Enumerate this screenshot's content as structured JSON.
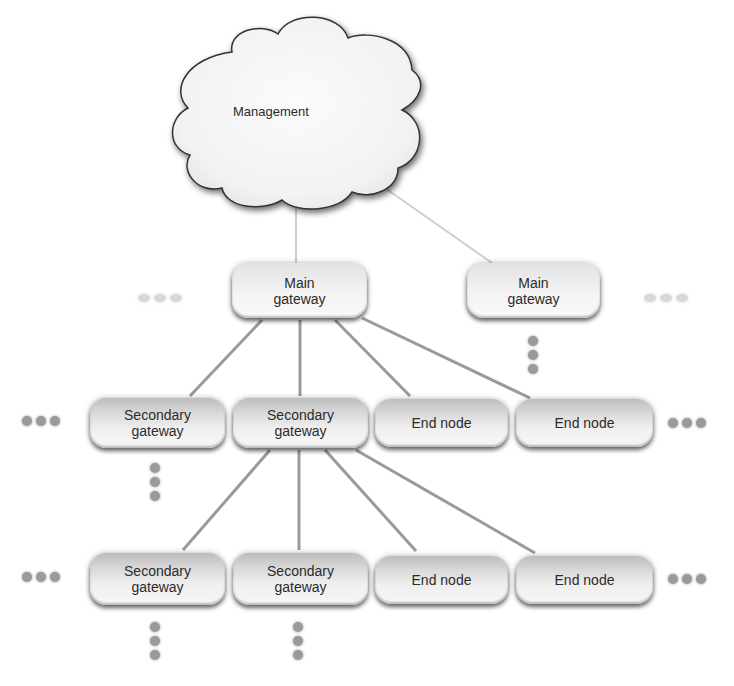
{
  "diagram": {
    "cloud": {
      "label": "Management"
    },
    "main_gateways": [
      {
        "label": "Main\ngateway"
      },
      {
        "label": "Main\ngateway"
      }
    ],
    "row1": [
      {
        "label": "Secondary\ngateway"
      },
      {
        "label": "Secondary\ngateway"
      },
      {
        "label": "End node"
      },
      {
        "label": "End node"
      }
    ],
    "row2": [
      {
        "label": "Secondary\ngateway"
      },
      {
        "label": "Secondary\ngateway"
      },
      {
        "label": "End node"
      },
      {
        "label": "End node"
      }
    ],
    "ellipsis_icon": "ellipsis-dots",
    "colors": {
      "line": "#9a9a9a",
      "cloud_line": "#c8c8c8",
      "node_text": "#2b2b2b",
      "dot": "#9a9a9a"
    }
  }
}
